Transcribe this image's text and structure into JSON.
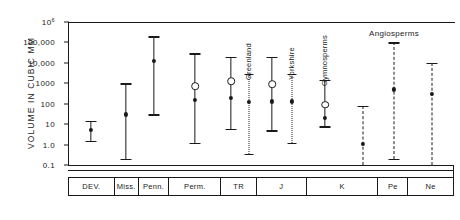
{
  "chart_data": {
    "type": "line",
    "title": "",
    "xlabel": "",
    "ylabel": "VOLUME  IN  CUBIC  MM",
    "scale": "log",
    "ylim": [
      0.1,
      1000000
    ],
    "grid": false,
    "legend_position": "none",
    "ytick_labels": [
      "10",
      "100,000",
      "10,000",
      "1000",
      "100",
      "10",
      "1.0",
      "0.1"
    ],
    "ytick_exponent_top": "6",
    "ytick_values": [
      1000000,
      100000,
      10000,
      1000,
      100,
      10,
      1.0,
      0.1
    ],
    "categories": [
      "DEV.",
      "Miss.",
      "Penn.",
      "Perm.",
      "TR",
      "J",
      "K",
      "Pe",
      "Ne"
    ],
    "series": [
      {
        "name": "DEV.",
        "category": "DEV.",
        "style": "solid",
        "annotation": "",
        "upper": 15,
        "lower": 1.5,
        "mean": 5,
        "median": null
      },
      {
        "name": "Miss.",
        "category": "Miss.",
        "style": "solid",
        "annotation": "",
        "upper": 1000,
        "lower": 0.2,
        "mean": 30,
        "median": null
      },
      {
        "name": "Penn.",
        "category": "Penn.",
        "style": "solid",
        "annotation": "",
        "upper": 200000,
        "lower": 30,
        "mean": 12000,
        "median": null
      },
      {
        "name": "Perm.",
        "category": "Perm.",
        "style": "solid",
        "annotation": "",
        "upper": 30000,
        "lower": 1.2,
        "mean": 150,
        "median": 700
      },
      {
        "name": "TR",
        "category": "TR",
        "style": "solid",
        "annotation": "",
        "upper": 20000,
        "lower": 6,
        "mean": 200,
        "median": 1300
      },
      {
        "name": "TR Greenland",
        "category": "TR",
        "style": "dotted",
        "annotation": "Greenland",
        "upper": 3000,
        "lower": 0.35,
        "mean": 120,
        "median": null
      },
      {
        "name": "J",
        "category": "J",
        "style": "solid",
        "annotation": "",
        "upper": 20000,
        "lower": 5,
        "mean": 130,
        "median": 900
      },
      {
        "name": "J Yorkshire",
        "category": "J",
        "style": "dotted",
        "annotation": "Yorkshire",
        "upper": 3000,
        "lower": 1.2,
        "mean": 130,
        "median": null
      },
      {
        "name": "K Gymnosperms",
        "category": "K",
        "style": "solid",
        "annotation": "Gymnosperms",
        "upper": 1500,
        "lower": 8,
        "mean": 20,
        "median": 90
      },
      {
        "name": "K Angiosperms",
        "category": "K",
        "style": "dashed",
        "annotation": "",
        "upper": 80,
        "lower": 0.1,
        "mean": 1.1,
        "median": null
      },
      {
        "name": "Pe Angiosperms",
        "category": "Pe",
        "style": "dashed",
        "annotation": "Angiosperms",
        "upper": 100000,
        "lower": 0.2,
        "mean": 500,
        "median": null
      },
      {
        "name": "Ne Angiosperms",
        "category": "Ne",
        "style": "dashed",
        "annotation": "",
        "upper": 10000,
        "lower": 0.1,
        "mean": 300,
        "median": null
      }
    ],
    "annotations": [
      {
        "text": "Greenland",
        "orientation": "vertical"
      },
      {
        "text": "Yorkshire",
        "orientation": "vertical"
      },
      {
        "text": "Gymnosperms",
        "orientation": "vertical"
      },
      {
        "text": "Angiosperms",
        "orientation": "horizontal"
      }
    ],
    "marker_legend": {
      "filled_dot": "mean",
      "open_circle": "median"
    }
  }
}
